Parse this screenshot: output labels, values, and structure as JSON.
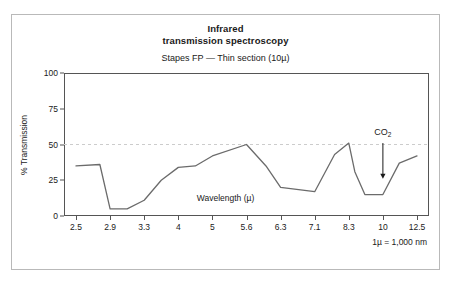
{
  "figure": {
    "title_line_1": "Infrared",
    "title_line_2": "transmission spectroscopy",
    "subtitle": "Stapes FP — Thin section (10µ)",
    "unit_note": "1µ = 1,000 nm",
    "border_color": "#b9b9b9",
    "axis_color": "#555555",
    "curve_color": "#6b6b6b",
    "reference_line_color": "#cccccc"
  },
  "annotations": {
    "co2_label": "CO",
    "co2_subscript": "2",
    "co2_arrow_name": "down-arrow-icon"
  },
  "chart_data": {
    "type": "line",
    "title": "Infrared transmission spectroscopy",
    "subtitle": "Stapes FP — Thin section (10µ)",
    "xlabel": "Wavelength (µ)",
    "ylabel": "% Transmission",
    "ylim": [
      0,
      100
    ],
    "yticks": [
      0,
      25,
      50,
      75,
      100
    ],
    "ytick_labels": [
      "0",
      "25",
      "50",
      "75",
      "100"
    ],
    "xtick_labels": [
      "2.5",
      "2.9",
      "3.3",
      "4",
      "5",
      "5.6",
      "6.3",
      "7.1",
      "8.3",
      "10",
      "12.5"
    ],
    "x_scale": "categorical-even-spacing",
    "grid": false,
    "legend": null,
    "reference_lines": [
      {
        "axis": "y",
        "value": 50,
        "style": "dashed",
        "color": "#cccccc"
      }
    ],
    "series": [
      {
        "name": "% Transmission",
        "x": [
          2.5,
          2.78,
          2.9,
          3.1,
          3.3,
          3.65,
          4.0,
          4.5,
          5.0,
          5.6,
          6.0,
          6.3,
          7.1,
          7.8,
          8.3,
          8.6,
          9.1,
          10.0,
          11.2,
          12.5
        ],
        "values": [
          35,
          36,
          5,
          5,
          11,
          25,
          34,
          35,
          42,
          50,
          35,
          20,
          17,
          43,
          51,
          31,
          15,
          15,
          37,
          42
        ]
      }
    ],
    "annotations": [
      {
        "text": "CO2",
        "x": 10.0,
        "y": 58,
        "arrow_to_y": 26,
        "type": "arrow-label"
      }
    ],
    "notes": [
      "1µ = 1,000 nm"
    ]
  }
}
